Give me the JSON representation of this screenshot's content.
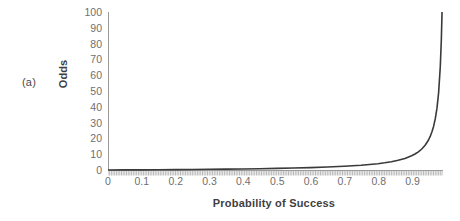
{
  "figure": {
    "panel_label": "(a)",
    "background_color": "#ffffff",
    "axis_color": "#9a9a9a",
    "curve_color": "#3a3a3a",
    "tick_label_color": "#6f6f6f",
    "axis_title_color": "#3f3f3f"
  },
  "chart_data": {
    "type": "line",
    "title": "",
    "subtitle": "",
    "xlabel": "Probability of Success",
    "ylabel": "Odds",
    "xlim": [
      0,
      0.99
    ],
    "ylim": [
      0,
      100
    ],
    "grid": false,
    "legend": false,
    "legend_position": "none",
    "annotations": [
      "(a)"
    ],
    "xticks": [
      0,
      0.1,
      0.2,
      0.3,
      0.4,
      0.5,
      0.6,
      0.7,
      0.8,
      0.9
    ],
    "xtick_labels": [
      "0",
      "0.1",
      "0.2",
      "0.3",
      "0.4",
      "0.5",
      "0.6",
      "0.7",
      "0.8",
      "0.9"
    ],
    "yticks": [
      0,
      10,
      20,
      30,
      40,
      50,
      60,
      70,
      80,
      90,
      100
    ],
    "ytick_labels": [
      "0",
      "10",
      "20",
      "30",
      "40",
      "50",
      "60",
      "70",
      "80",
      "90",
      "100"
    ],
    "minor_xticks_interval": 0.005,
    "series": [
      {
        "name": "Odds = p / (1 - p)",
        "x": [
          0,
          0.05,
          0.1,
          0.15,
          0.2,
          0.25,
          0.3,
          0.35,
          0.4,
          0.45,
          0.5,
          0.55,
          0.6,
          0.65,
          0.7,
          0.75,
          0.8,
          0.82,
          0.84,
          0.86,
          0.88,
          0.9,
          0.91,
          0.92,
          0.93,
          0.94,
          0.95,
          0.955,
          0.96,
          0.965,
          0.97,
          0.975,
          0.98,
          0.985,
          0.988,
          0.99,
          0.9901
        ],
        "y": [
          0,
          0.05,
          0.11,
          0.18,
          0.25,
          0.33,
          0.43,
          0.54,
          0.67,
          0.82,
          1.0,
          1.22,
          1.5,
          1.86,
          2.33,
          3.0,
          4.0,
          4.56,
          5.25,
          6.14,
          7.33,
          9.0,
          10.11,
          11.5,
          13.29,
          15.67,
          19.0,
          21.22,
          24.0,
          27.57,
          32.33,
          39.0,
          49.0,
          65.67,
          82.33,
          99.0,
          100.0
        ]
      }
    ]
  }
}
